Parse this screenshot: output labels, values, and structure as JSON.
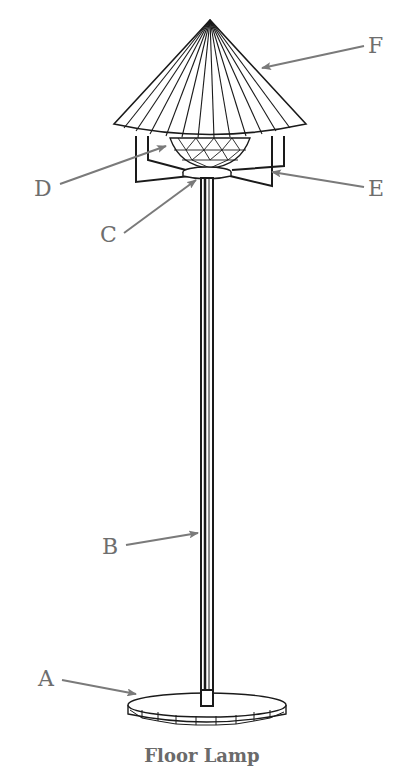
{
  "diagram": {
    "title": "Floor Lamp",
    "colors": {
      "line": "#1a1a1a",
      "label": "#6e6e6e",
      "arrow": "#7a7a7a",
      "background": "#ffffff"
    },
    "labels": [
      {
        "id": "A",
        "text": "A",
        "part": "base"
      },
      {
        "id": "B",
        "text": "B",
        "part": "pole"
      },
      {
        "id": "C",
        "text": "C",
        "part": "collar"
      },
      {
        "id": "D",
        "text": "D",
        "part": "bowl"
      },
      {
        "id": "E",
        "text": "E",
        "part": "frame"
      },
      {
        "id": "F",
        "text": "F",
        "part": "shade"
      }
    ]
  }
}
